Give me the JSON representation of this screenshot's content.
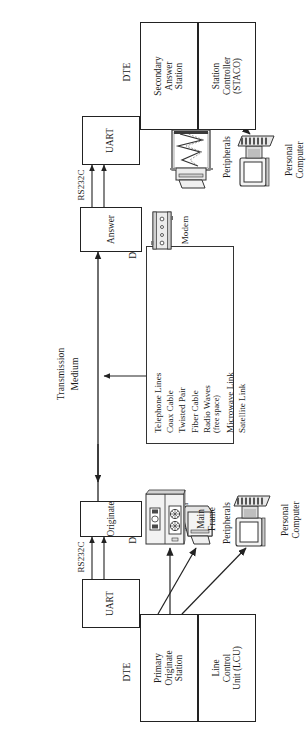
{
  "diagram": {
    "orientation": "rotated-90-ccw",
    "nodes": {
      "primary_dte": {
        "role_label": "DTE",
        "station_name": "Primary\nOriginate\nStation",
        "controller": "Line\nControl\nUnit (LCU)",
        "uart": "UART"
      },
      "originate_dce": {
        "role_label": "DCE",
        "name": "Originate",
        "device_label": "Modem"
      },
      "answer_dce": {
        "role_label": "DCE",
        "name": "Answer",
        "device_label": "Modem"
      },
      "secondary_dte": {
        "role_label": "DTE",
        "station_name": "Secondary\nAnswer\nStation",
        "controller": "Station\nController\n(STACO)",
        "uart": "UART"
      }
    },
    "interfaces": {
      "rs232c_left": "RS232C",
      "rs232c_right": "RS232C"
    },
    "transmission_medium": {
      "label": "Transmission\nMedium",
      "label_line1": "Transmission",
      "label_line2": "Medium",
      "options": [
        "Telephone Lines",
        "Coax Cable",
        "Twisted Pair",
        "Fiber Cable",
        "Radio Waves",
        "(free space)",
        "Microwave Link",
        "Satellite Link"
      ]
    },
    "left_peripherals": [
      {
        "name": "Peripherals",
        "icon": "printer-icon"
      },
      {
        "name": "Main\nFrame",
        "icon": "mainframe-icon"
      },
      {
        "name": "Personal\nComputer",
        "icon": "personal-computer-icon"
      }
    ],
    "right_peripherals": [
      {
        "name": "Peripherals",
        "icon": "plotter-icon"
      },
      {
        "name": "Personal\nComputer",
        "icon": "personal-computer-icon"
      }
    ],
    "colors": {
      "stroke": "#222222",
      "background": "#ffffff",
      "icon_fill": "#e9e9e9",
      "icon_shade": "#b9b9b9"
    }
  }
}
